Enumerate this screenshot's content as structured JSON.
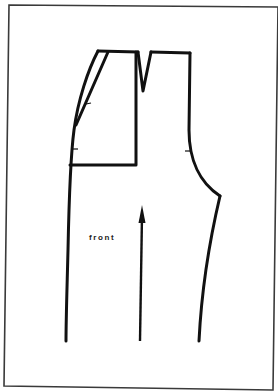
{
  "figure": {
    "type": "sewing-pattern",
    "piece": "trouser front",
    "label": "front",
    "colors": {
      "line": "#111111",
      "frame": "#3a3a3a",
      "background": "#ffffff"
    },
    "elements": [
      "border-frame",
      "waistband-top-line",
      "waist-dart",
      "slanted-pocket-line",
      "pocket-facing-rectangle",
      "side-seam",
      "crotch-curve",
      "inseam",
      "grain-line-arrow",
      "notches"
    ]
  }
}
